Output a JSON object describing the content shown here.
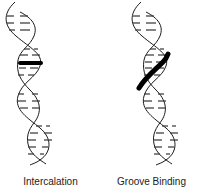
{
  "diagram": {
    "panels": [
      {
        "id": "intercalation",
        "label": "Intercalation",
        "binder": "horizontal-bar-between-base-pairs"
      },
      {
        "id": "groove-binding",
        "label": "Groove Binding",
        "binder": "diagonal-bar-along-groove"
      }
    ],
    "colors": {
      "strand": "#1a1a1a",
      "base_pair": "#333333",
      "ligand": "#000000",
      "background": "#ffffff"
    }
  }
}
